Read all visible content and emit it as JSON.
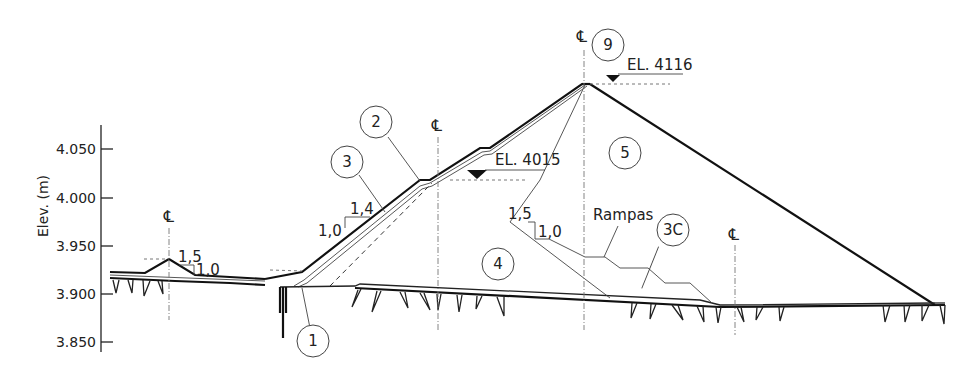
{
  "diagram": {
    "y_axis": {
      "label": "Elev. (m)",
      "ticks": [
        "4.050",
        "4.000",
        "3.950",
        "3.900",
        "3.850"
      ]
    },
    "centerline_symbol": "℄",
    "elevations": [
      {
        "id": "crest",
        "label": "EL. 4116"
      },
      {
        "id": "berm",
        "label": "EL. 4015"
      }
    ],
    "slopes": [
      {
        "id": "left-dike",
        "h": "1,5",
        "v": "1,0"
      },
      {
        "id": "upstream-face",
        "h": "1,4",
        "v": "1,0"
      },
      {
        "id": "internal",
        "h": "1,5",
        "v": "1,0"
      }
    ],
    "zones": [
      {
        "id": "1",
        "label": "1"
      },
      {
        "id": "2",
        "label": "2"
      },
      {
        "id": "3",
        "label": "3"
      },
      {
        "id": "3C",
        "label": "3C"
      },
      {
        "id": "4",
        "label": "4"
      },
      {
        "id": "5",
        "label": "5"
      },
      {
        "id": "9",
        "label": "9"
      }
    ],
    "annotations": {
      "ramps": "Rampas"
    }
  }
}
